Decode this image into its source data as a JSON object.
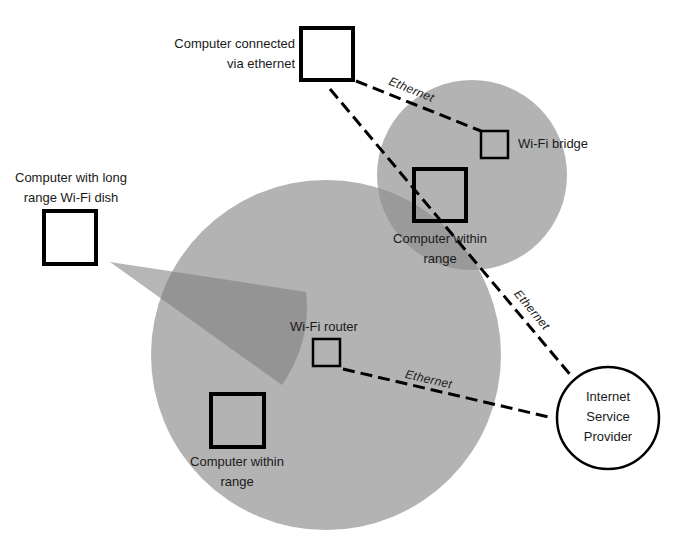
{
  "diagram": {
    "colors": {
      "background": "#ffffff",
      "range_circle": "#b3b3b3",
      "overlap": "#999999",
      "dish_beam": "#8f8f8f",
      "stroke": "#000000",
      "text": "#1a1a1a"
    },
    "nodes": {
      "computer_ethernet": {
        "label_line1": "Computer connected",
        "label_line2": "via ethernet"
      },
      "wifi_bridge": {
        "label": "Wi-Fi bridge"
      },
      "computer_bridge_range": {
        "label_line1": "Computer within",
        "label_line2": "range"
      },
      "computer_dish": {
        "label_line1": "Computer with long",
        "label_line2": "range Wi-Fi dish"
      },
      "wifi_router": {
        "label": "Wi-Fi router"
      },
      "computer_router_range": {
        "label_line1": "Computer within",
        "label_line2": "range"
      },
      "isp": {
        "label_line1": "Internet",
        "label_line2": "Service",
        "label_line3": "Provider"
      }
    },
    "connections": {
      "ethernet_bridge": {
        "label": "Ethernet"
      },
      "ethernet_isp_top": {
        "label": "Ethernet"
      },
      "ethernet_router": {
        "label": "Ethernet"
      }
    }
  }
}
